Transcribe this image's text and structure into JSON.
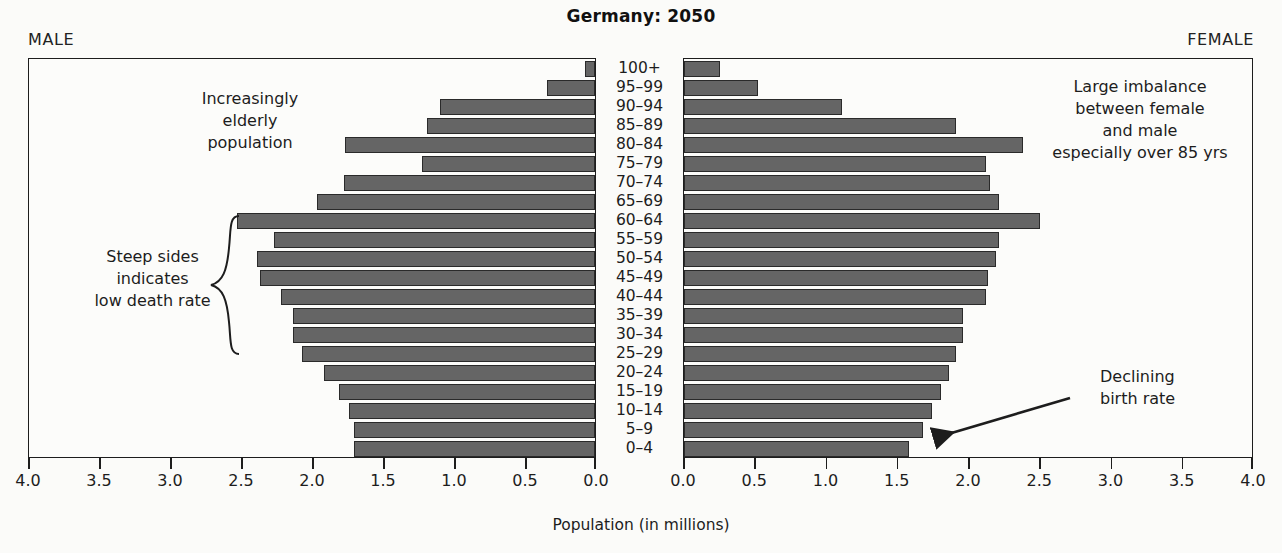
{
  "title": "Germany: 2050",
  "male_label": "MALE",
  "female_label": "FEMALE",
  "xaxis_title": "Population (in millions)",
  "annotations": {
    "elderly": "Increasingly\nelderly\npopulation",
    "steep": "Steep sides\nindicates\nlow death rate",
    "imbalance": "Large imbalance\nbetween female\nand male\nespecially over 85 yrs",
    "birth": "Declining\nbirth rate"
  },
  "colors": {
    "bar_fill": "#656565",
    "bar_stroke": "#2a2a2a",
    "axis": "#1d1d1d",
    "background": "#fbfbf9"
  },
  "chart_data": {
    "type": "bar",
    "title": "Germany: 2050",
    "xlabel": "Population (in millions)",
    "ylabel": "",
    "orientation": "horizontal",
    "layout": "population-pyramid",
    "grid": false,
    "legend": "none",
    "xlim_male": [
      4.0,
      0.0
    ],
    "xlim_female": [
      0.0,
      4.0
    ],
    "tick_values_male": [
      "4.0",
      "3.5",
      "3.0",
      "2.5",
      "2.0",
      "1.5",
      "1.0",
      "0.5",
      "0.0"
    ],
    "tick_values_female": [
      "0.0",
      "0.5",
      "1.0",
      "1.5",
      "2.0",
      "2.5",
      "3.0",
      "3.5",
      "4.0"
    ],
    "categories": [
      "100+",
      "95–99",
      "90–94",
      "85–89",
      "80–84",
      "75–79",
      "70–74",
      "65–69",
      "60–64",
      "55–59",
      "50–54",
      "45–49",
      "40–44",
      "35–39",
      "30–34",
      "25–29",
      "20–24",
      "15–19",
      "10–14",
      "5–9",
      "0–4"
    ],
    "series": [
      {
        "name": "Male",
        "side": "left",
        "values": [
          0.07,
          0.34,
          1.09,
          1.18,
          1.76,
          1.22,
          1.77,
          1.96,
          2.52,
          2.26,
          2.38,
          2.36,
          2.21,
          2.13,
          2.13,
          2.06,
          1.91,
          1.8,
          1.73,
          1.7,
          1.7
        ]
      },
      {
        "name": "Female",
        "side": "right",
        "values": [
          0.25,
          0.52,
          1.11,
          1.91,
          2.38,
          2.12,
          2.15,
          2.21,
          2.5,
          2.21,
          2.19,
          2.13,
          2.12,
          1.96,
          1.96,
          1.91,
          1.86,
          1.8,
          1.74,
          1.68,
          1.58
        ]
      }
    ]
  }
}
